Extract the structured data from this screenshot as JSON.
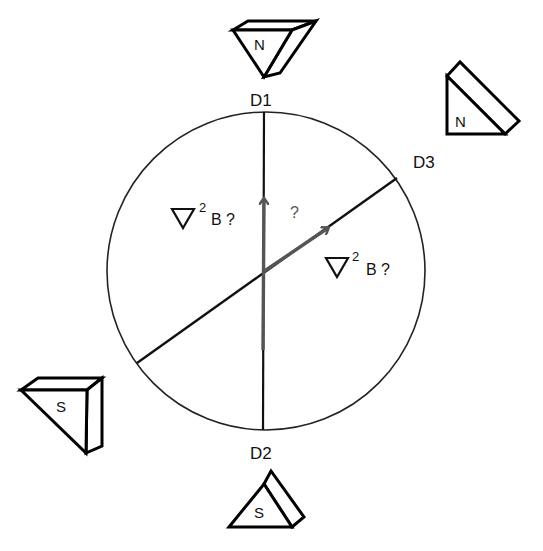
{
  "diagram": {
    "type": "magnetometer-probe-orientation",
    "circle": {
      "cx": 266,
      "cy": 271,
      "r": 159,
      "stroke": "#222222"
    },
    "axes": [
      {
        "id": "D1-D2",
        "from_label": "D1",
        "to_label": "D2",
        "x1": 264,
        "y1": 112,
        "x2": 263,
        "y2": 430
      },
      {
        "id": "D3",
        "label": "D3",
        "x1": 137,
        "y1": 363,
        "x2": 397,
        "y2": 178
      }
    ],
    "arrows": [
      {
        "id": "arrow-vertical",
        "x1": 263,
        "y1": 350,
        "x2": 264,
        "y2": 199,
        "color": "#555555"
      },
      {
        "id": "arrow-diagonal",
        "x1": 263,
        "y1": 272,
        "x2": 328,
        "y2": 228,
        "color": "#555555"
      }
    ],
    "labels": {
      "d1": "D1",
      "d2": "D2",
      "d3": "D3",
      "left_expr": {
        "nabla": "∇",
        "exp": "2",
        "rest": "B ?"
      },
      "right_expr": {
        "nabla": "∇",
        "exp": "2",
        "rest": "B ?"
      },
      "center_question": "?"
    },
    "magnets": [
      {
        "id": "magnet-top",
        "pole": "N",
        "near": "D1"
      },
      {
        "id": "magnet-right",
        "pole": "N",
        "near": "D3"
      },
      {
        "id": "magnet-left",
        "pole": "S",
        "near": "lower-left"
      },
      {
        "id": "magnet-bottom",
        "pole": "S",
        "near": "D2"
      }
    ],
    "colors": {
      "line": "#111111",
      "arrow": "#555555",
      "text": "#111111",
      "background": "#ffffff"
    }
  }
}
